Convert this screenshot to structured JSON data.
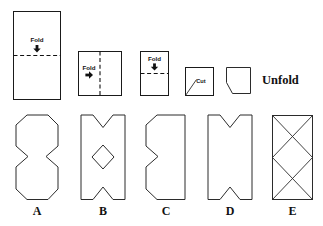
{
  "diagram": {
    "stroke_color": "#2b2b2b",
    "paper_fill": "#ffffff",
    "text_color": "#111111"
  },
  "steps": [
    {
      "id": "step-1",
      "label": "Fold",
      "arrow": "down-arrow-icon",
      "arrow_glyph": "↓",
      "fold_line": "horizontal",
      "shape": "tall-rectangle"
    },
    {
      "id": "step-2",
      "label": "Fold",
      "arrow": "right-arrow-icon",
      "arrow_glyph": "→",
      "fold_line": "vertical",
      "shape": "square"
    },
    {
      "id": "step-3",
      "label": "Fold",
      "arrow": "down-arrow-icon",
      "arrow_glyph": "↓",
      "fold_line": "horizontal",
      "shape": "narrow-rectangle"
    },
    {
      "id": "step-4",
      "label": "Cut",
      "arrow": "diagonal-cut-line",
      "shape": "square-with-corner-cut-marked"
    },
    {
      "id": "step-5",
      "label": "",
      "shape": "square-with-corner-removed"
    }
  ],
  "unfold": {
    "label": "Unfold"
  },
  "options": [
    {
      "letter": "A",
      "name": "option-a",
      "description": "octagon with concave notches on left and right sides"
    },
    {
      "letter": "B",
      "name": "option-b",
      "description": "rectangle with v-notches top and bottom and a diamond hole in the center"
    },
    {
      "letter": "C",
      "name": "option-c",
      "description": "shape with angled left corners and a v-notch on the left edge"
    },
    {
      "letter": "D",
      "name": "option-d",
      "description": "rectangle with v-notches at top and bottom"
    },
    {
      "letter": "E",
      "name": "option-e",
      "description": "rectangle with two diamonds formed by crossing diagonal lines"
    }
  ]
}
